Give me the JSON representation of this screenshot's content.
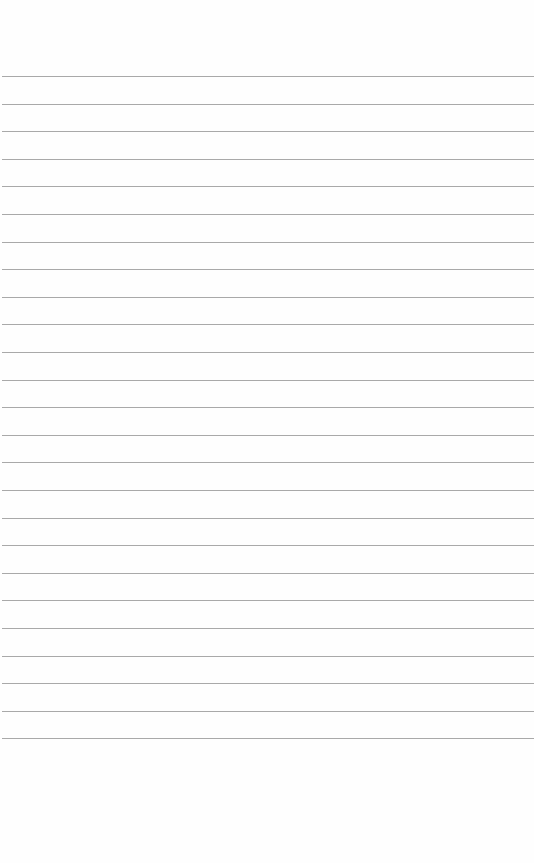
{
  "page": {
    "type": "lined-paper",
    "background_color": "#fefefe",
    "line_color": "#9a9a9a",
    "line_count": 25,
    "first_line_y": 76,
    "line_spacing": 27.6
  }
}
